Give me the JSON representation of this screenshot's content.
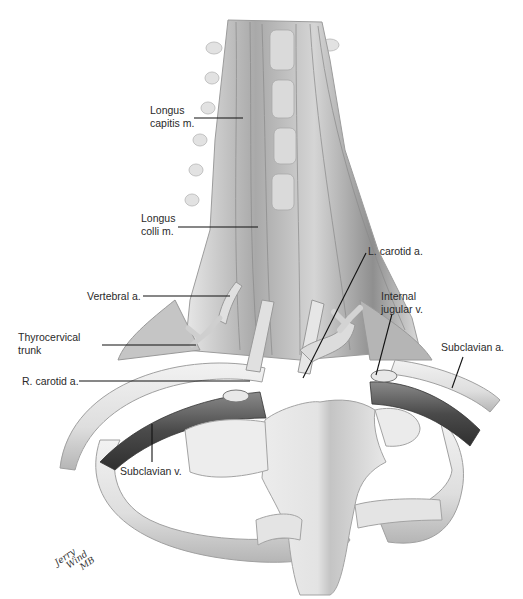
{
  "figure": {
    "colors": {
      "bone": "#e4e4e4",
      "bone_shadow": "#a8a8a8",
      "muscle": "#b9b9b9",
      "muscle_dark": "#7d7d7d",
      "vein": "#5a5a5a",
      "artery": "#d6d6d6",
      "leader": "#111111",
      "text": "#2a2a2a"
    }
  },
  "labels": [
    {
      "id": "longus-capitis",
      "lines": [
        "Longus",
        "capitis m."
      ]
    },
    {
      "id": "longus-colli",
      "lines": [
        "Longus",
        "colli m."
      ]
    },
    {
      "id": "vertebral-a",
      "lines": [
        "Vertebral a."
      ]
    },
    {
      "id": "thyrocervical-trunk",
      "lines": [
        "Thyrocervical",
        "trunk"
      ]
    },
    {
      "id": "r-carotid-a",
      "lines": [
        "R. carotid a."
      ]
    },
    {
      "id": "l-carotid-a",
      "lines": [
        "L. carotid a."
      ]
    },
    {
      "id": "internal-jugular-v",
      "lines": [
        "Internal",
        "jugular v."
      ]
    },
    {
      "id": "subclavian-a",
      "lines": [
        "Subclavian a."
      ]
    },
    {
      "id": "subclavian-v",
      "lines": [
        "Subclavian v."
      ]
    }
  ],
  "signature": [
    "Jerry",
    "Wind",
    "MB"
  ]
}
